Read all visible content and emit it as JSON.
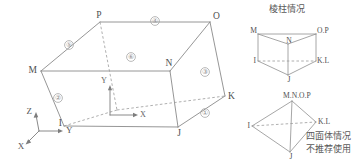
{
  "figure": {
    "colors": {
      "line": "#8a8a8a",
      "hidden_line": "#9a9a9a",
      "text": "#5f5f5f",
      "background": "#ffffff"
    }
  },
  "main_diagram": {
    "name": "hexahedron",
    "vertices": [
      {
        "id": "P",
        "label": "P",
        "x": 100,
        "y": 22,
        "anchor": "middle",
        "lx": 99,
        "ly": 16
      },
      {
        "id": "O",
        "label": "O",
        "x": 210,
        "y": 22,
        "anchor": "start",
        "lx": 213,
        "ly": 17
      },
      {
        "id": "M",
        "label": "M",
        "x": 41,
        "y": 71,
        "anchor": "end",
        "lx": 37,
        "ly": 71
      },
      {
        "id": "N",
        "label": "N",
        "x": 170,
        "y": 71,
        "anchor": "middle",
        "lx": 169,
        "ly": 64
      },
      {
        "id": "I",
        "label": "I",
        "x": 64,
        "y": 126,
        "anchor": "end",
        "lx": 62,
        "ly": 124
      },
      {
        "id": "J",
        "label": "J",
        "x": 178,
        "y": 127,
        "anchor": "middle",
        "lx": 179,
        "ly": 134
      },
      {
        "id": "K",
        "label": "K",
        "x": 225,
        "y": 96,
        "anchor": "start",
        "lx": 228,
        "ly": 97
      },
      {
        "id": "L",
        "label": "L",
        "x": 143,
        "y": 87,
        "anchor": "start",
        "lx": 0,
        "ly": 0
      }
    ],
    "face_numbers": [
      {
        "label": "①",
        "x": 205,
        "y": 113
      },
      {
        "label": "②",
        "x": 58,
        "y": 98
      },
      {
        "label": "③",
        "x": 205,
        "y": 72
      },
      {
        "label": "④",
        "x": 155,
        "y": 21
      },
      {
        "label": "⑤",
        "x": 69,
        "y": 45
      },
      {
        "label": "⑥",
        "x": 131,
        "y": 57
      }
    ],
    "global_axes": {
      "origin_x": 39,
      "origin_y": 131,
      "labels": [
        {
          "id": "Z",
          "label": "Z",
          "x": 32,
          "y": 112
        },
        {
          "id": "Y",
          "label": "Y",
          "x": 66,
          "y": 131
        },
        {
          "id": "X",
          "label": "X",
          "x": 21,
          "y": 147
        }
      ]
    },
    "local_axes": {
      "origin_x": 110,
      "origin_y": 115,
      "labels": [
        {
          "id": "Y",
          "label": "Y",
          "x": 104,
          "y": 81
        },
        {
          "id": "X",
          "label": "X",
          "x": 143,
          "y": 115
        }
      ]
    }
  },
  "prism_case": {
    "caption": "棱柱情况",
    "caption_x": 287,
    "caption_y": 9,
    "vertices": [
      {
        "id": "M",
        "label": "M",
        "x": 258,
        "y": 34,
        "anchor": "end",
        "lx": 257,
        "ly": 31
      },
      {
        "id": "O.P",
        "label": "O.P",
        "x": 316,
        "y": 34,
        "anchor": "start",
        "lx": 317,
        "ly": 31
      },
      {
        "id": "N",
        "label": "N",
        "x": 288,
        "y": 44,
        "anchor": "middle",
        "lx": 289,
        "ly": 41
      },
      {
        "id": "I",
        "label": "I",
        "x": 258,
        "y": 61,
        "anchor": "end",
        "lx": 256,
        "ly": 61
      },
      {
        "id": "K.L",
        "label": "K.L",
        "x": 316,
        "y": 61,
        "anchor": "start",
        "lx": 317,
        "ly": 61
      },
      {
        "id": "J",
        "label": "J",
        "x": 288,
        "y": 75,
        "anchor": "middle",
        "lx": 289,
        "ly": 80
      }
    ]
  },
  "tetrahedron_case": {
    "caption_line1": "四面体情况",
    "caption_line2": "不推荐使用",
    "caption_x": 306,
    "caption_y1": 136,
    "caption_y2": 149,
    "vertices": [
      {
        "id": "M.N.O.P",
        "label": "M.N.O.P",
        "x": 292,
        "y": 101,
        "anchor": "start",
        "lx": 283,
        "ly": 96
      },
      {
        "id": "I",
        "label": "I",
        "x": 252,
        "y": 126,
        "anchor": "end",
        "lx": 250,
        "ly": 126
      },
      {
        "id": "K.L",
        "label": "K.L",
        "x": 316,
        "y": 122,
        "anchor": "start",
        "lx": 318,
        "ly": 122
      },
      {
        "id": "J",
        "label": "J",
        "x": 290,
        "y": 152,
        "anchor": "middle",
        "lx": 291,
        "ly": 157
      }
    ]
  }
}
